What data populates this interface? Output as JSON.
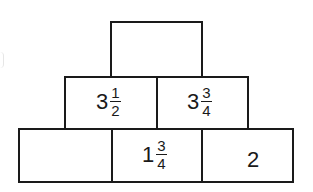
{
  "diagram": {
    "type": "number-pyramid",
    "line_color": "#1a1a1a",
    "background_color": "#ffffff",
    "rows": [
      {
        "name": "top",
        "bricks": [
          {
            "id": "top",
            "whole": "",
            "numerator": "",
            "denominator": "",
            "display": ""
          }
        ]
      },
      {
        "name": "middle",
        "bricks": [
          {
            "id": "middle-left",
            "whole": "3",
            "numerator": "1",
            "denominator": "2",
            "display": "3 1/2"
          },
          {
            "id": "middle-right",
            "whole": "3",
            "numerator": "3",
            "denominator": "4",
            "display": "3 3/4"
          }
        ]
      },
      {
        "name": "bottom",
        "bricks": [
          {
            "id": "bottom-left",
            "whole": "",
            "numerator": "",
            "denominator": "",
            "display": ""
          },
          {
            "id": "bottom-middle",
            "whole": "1",
            "numerator": "3",
            "denominator": "4",
            "display": "1 3/4"
          },
          {
            "id": "bottom-right",
            "whole": "2",
            "numerator": "",
            "denominator": "",
            "display": "2"
          }
        ]
      }
    ]
  }
}
